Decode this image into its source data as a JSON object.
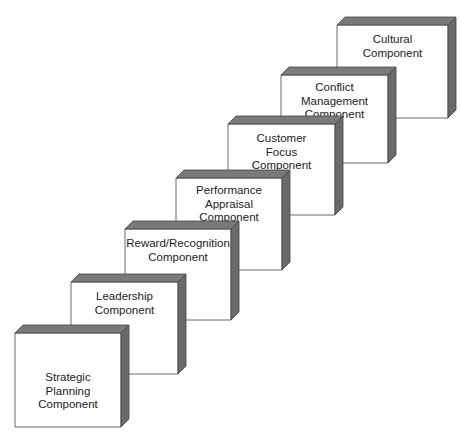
{
  "diagram": {
    "type": "stacked-3d-boxes-staircase",
    "colors": {
      "face": "#ffffff",
      "top": "#7a7a7a",
      "side": "#6a6a6a",
      "outline": "#444444",
      "text": "#222222"
    },
    "boxes": [
      {
        "id": "strategic-planning",
        "label": "Strategic\nPlanning\nComponent",
        "x": 15,
        "y": 333,
        "w": 106,
        "h": 94,
        "ty": 36
      },
      {
        "id": "leadership",
        "label": "Leadership\nComponent",
        "x": 71,
        "y": 282,
        "w": 107,
        "h": 92,
        "ty": 6
      },
      {
        "id": "reward-recognition",
        "label": "Reward/Recognition\nComponent",
        "x": 125,
        "y": 229,
        "w": 106,
        "h": 91,
        "ty": 6
      },
      {
        "id": "performance-appraisal",
        "label": "Performance\nAppraisal\nComponent",
        "x": 176,
        "y": 178,
        "w": 106,
        "h": 92,
        "ty": 4
      },
      {
        "id": "customer-focus",
        "label": "Customer\nFocus\nComponent",
        "x": 228,
        "y": 124,
        "w": 107,
        "h": 91,
        "ty": 6
      },
      {
        "id": "conflict-management",
        "label": "Conflict\nManagement\nComponent",
        "x": 281,
        "y": 75,
        "w": 107,
        "h": 88,
        "ty": 4
      },
      {
        "id": "cultural",
        "label": "Cultural\nComponent",
        "x": 337,
        "y": 25,
        "w": 111,
        "h": 93,
        "ty": 6
      }
    ]
  }
}
